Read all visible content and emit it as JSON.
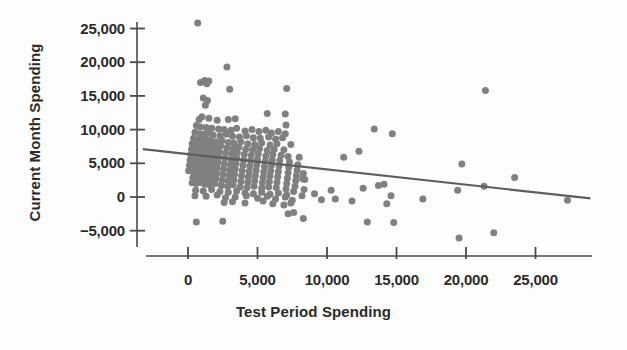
{
  "chart_data": {
    "type": "scatter",
    "title": "",
    "xlabel": "Test Period Spending",
    "ylabel": "Current Month Spending",
    "xlim": [
      -4000,
      29500
    ],
    "ylim": [
      -7500,
      26500
    ],
    "grid": false,
    "legend": null,
    "xticks": [
      0,
      5000,
      10000,
      15000,
      20000,
      25000
    ],
    "xticklabels": [
      "0",
      "5,000",
      "10,000",
      "15,000",
      "20,000",
      "25,000"
    ],
    "yticks": [
      -5000,
      0,
      5000,
      10000,
      15000,
      20000,
      25000
    ],
    "yticklabels": [
      "−5,000",
      "0",
      "5,000",
      "10,000",
      "15,000",
      "20,000",
      "25,000"
    ],
    "marker_color": "#808080",
    "marker_size": 7,
    "line_color": "#5e5e5e",
    "axis_color": "#4a4a4a",
    "text_color": "#2b2b2b",
    "background": "#fdfdfd",
    "trendline": {
      "type": "linear-fit",
      "x_start": -3250,
      "y_start": 7100,
      "x_end": 28950,
      "y_end": -200,
      "slope": -0.2267,
      "intercept": 6363
    },
    "points": [
      [
        700,
        25800
      ],
      [
        2800,
        19300
      ],
      [
        1200,
        17300
      ],
      [
        1500,
        17200
      ],
      [
        900,
        17000
      ],
      [
        1350,
        16800
      ],
      [
        21400,
        15800
      ],
      [
        7100,
        16100
      ],
      [
        3000,
        16000
      ],
      [
        1100,
        14700
      ],
      [
        1400,
        14300
      ],
      [
        1250,
        13600
      ],
      [
        5700,
        12400
      ],
      [
        7000,
        12300
      ],
      [
        3400,
        11600
      ],
      [
        2900,
        11500
      ],
      [
        1000,
        11900
      ],
      [
        1500,
        11700
      ],
      [
        800,
        11500
      ],
      [
        2100,
        11400
      ],
      [
        7050,
        10700
      ],
      [
        13400,
        10100
      ],
      [
        14700,
        9400
      ],
      [
        600,
        10600
      ],
      [
        900,
        10400
      ],
      [
        1300,
        10300
      ],
      [
        1700,
        10200
      ],
      [
        2200,
        10100
      ],
      [
        2600,
        10000
      ],
      [
        3100,
        9900
      ],
      [
        3500,
        10200
      ],
      [
        4100,
        9800
      ],
      [
        4600,
        10000
      ],
      [
        5100,
        9700
      ],
      [
        5600,
        9900
      ],
      [
        6000,
        9500
      ],
      [
        6500,
        9700
      ],
      [
        7000,
        9400
      ],
      [
        500,
        9600
      ],
      [
        850,
        9400
      ],
      [
        1150,
        9300
      ],
      [
        1450,
        9500
      ],
      [
        1800,
        9200
      ],
      [
        2300,
        9100
      ],
      [
        2750,
        9300
      ],
      [
        3200,
        9000
      ],
      [
        3700,
        8900
      ],
      [
        4200,
        9100
      ],
      [
        4700,
        8800
      ],
      [
        5200,
        8700
      ],
      [
        5800,
        8900
      ],
      [
        6300,
        8600
      ],
      [
        6800,
        8800
      ],
      [
        400,
        8700
      ],
      [
        750,
        8500
      ],
      [
        1050,
        8400
      ],
      [
        1350,
        8600
      ],
      [
        1650,
        8300
      ],
      [
        2000,
        8200
      ],
      [
        2450,
        8400
      ],
      [
        2900,
        8100
      ],
      [
        3300,
        8000
      ],
      [
        3800,
        8200
      ],
      [
        4300,
        7900
      ],
      [
        4800,
        7800
      ],
      [
        5300,
        8000
      ],
      [
        5900,
        7700
      ],
      [
        6400,
        7900
      ],
      [
        7400,
        7800
      ],
      [
        300,
        7900
      ],
      [
        650,
        7700
      ],
      [
        950,
        7600
      ],
      [
        1250,
        7800
      ],
      [
        1550,
        7500
      ],
      [
        1900,
        7400
      ],
      [
        2350,
        7600
      ],
      [
        2800,
        7300
      ],
      [
        3250,
        7200
      ],
      [
        3650,
        7400
      ],
      [
        4150,
        7100
      ],
      [
        4650,
        7000
      ],
      [
        5150,
        7200
      ],
      [
        5700,
        6900
      ],
      [
        6200,
        7100
      ],
      [
        6900,
        7000
      ],
      [
        250,
        7100
      ],
      [
        600,
        6900
      ],
      [
        900,
        6800
      ],
      [
        1200,
        7000
      ],
      [
        1500,
        6700
      ],
      [
        1850,
        6600
      ],
      [
        2250,
        6800
      ],
      [
        2700,
        6500
      ],
      [
        3150,
        6400
      ],
      [
        3550,
        6600
      ],
      [
        4050,
        6300
      ],
      [
        4550,
        6200
      ],
      [
        5050,
        6400
      ],
      [
        5600,
        6100
      ],
      [
        6100,
        6300
      ],
      [
        6700,
        6200
      ],
      [
        7200,
        6000
      ],
      [
        200,
        6300
      ],
      [
        550,
        6100
      ],
      [
        850,
        6000
      ],
      [
        1150,
        6200
      ],
      [
        1450,
        5900
      ],
      [
        1800,
        5800
      ],
      [
        2200,
        6000
      ],
      [
        2650,
        5700
      ],
      [
        3100,
        5600
      ],
      [
        3500,
        5800
      ],
      [
        4000,
        5500
      ],
      [
        4500,
        5400
      ],
      [
        5000,
        5600
      ],
      [
        5550,
        5300
      ],
      [
        6050,
        5500
      ],
      [
        6600,
        5400
      ],
      [
        7300,
        5200
      ],
      [
        8000,
        5900
      ],
      [
        150,
        5500
      ],
      [
        500,
        5300
      ],
      [
        800,
        5200
      ],
      [
        1100,
        5400
      ],
      [
        1400,
        5100
      ],
      [
        1750,
        5000
      ],
      [
        2150,
        5200
      ],
      [
        2600,
        4900
      ],
      [
        3050,
        4800
      ],
      [
        3450,
        5000
      ],
      [
        3950,
        4700
      ],
      [
        4450,
        4600
      ],
      [
        4950,
        4800
      ],
      [
        5500,
        4500
      ],
      [
        6000,
        4700
      ],
      [
        6550,
        4600
      ],
      [
        7250,
        4400
      ],
      [
        7900,
        4800
      ],
      [
        100,
        4700
      ],
      [
        450,
        4500
      ],
      [
        750,
        4400
      ],
      [
        1050,
        4600
      ],
      [
        1350,
        4300
      ],
      [
        1700,
        4200
      ],
      [
        2100,
        4400
      ],
      [
        2550,
        4100
      ],
      [
        3000,
        4000
      ],
      [
        3400,
        4200
      ],
      [
        3900,
        3900
      ],
      [
        4400,
        3800
      ],
      [
        4900,
        4000
      ],
      [
        5450,
        3700
      ],
      [
        5950,
        3900
      ],
      [
        6500,
        3800
      ],
      [
        7200,
        3600
      ],
      [
        7850,
        4000
      ],
      [
        8300,
        3500
      ],
      [
        50,
        3900
      ],
      [
        400,
        3700
      ],
      [
        700,
        3600
      ],
      [
        1000,
        3800
      ],
      [
        1300,
        3500
      ],
      [
        1650,
        3400
      ],
      [
        2050,
        3600
      ],
      [
        2500,
        3300
      ],
      [
        2950,
        3200
      ],
      [
        3350,
        3400
      ],
      [
        3850,
        3100
      ],
      [
        4350,
        3000
      ],
      [
        4850,
        3200
      ],
      [
        5400,
        2900
      ],
      [
        5900,
        3100
      ],
      [
        6450,
        3000
      ],
      [
        7150,
        2800
      ],
      [
        7800,
        3200
      ],
      [
        8250,
        2700
      ],
      [
        350,
        2900
      ],
      [
        650,
        2800
      ],
      [
        950,
        3000
      ],
      [
        1250,
        2700
      ],
      [
        1600,
        2600
      ],
      [
        2000,
        2800
      ],
      [
        2450,
        2500
      ],
      [
        2900,
        2400
      ],
      [
        3300,
        2600
      ],
      [
        3800,
        2300
      ],
      [
        4300,
        2200
      ],
      [
        4800,
        2400
      ],
      [
        5350,
        2100
      ],
      [
        5850,
        2300
      ],
      [
        6400,
        2200
      ],
      [
        7100,
        2000
      ],
      [
        7750,
        2400
      ],
      [
        8400,
        2600
      ],
      [
        300,
        2100
      ],
      [
        600,
        2000
      ],
      [
        900,
        2200
      ],
      [
        1200,
        1900
      ],
      [
        1550,
        1800
      ],
      [
        1950,
        2000
      ],
      [
        2400,
        1700
      ],
      [
        2850,
        1600
      ],
      [
        3250,
        1800
      ],
      [
        3750,
        1500
      ],
      [
        4250,
        1400
      ],
      [
        4750,
        1600
      ],
      [
        5300,
        1300
      ],
      [
        5800,
        1500
      ],
      [
        6350,
        1400
      ],
      [
        7050,
        1200
      ],
      [
        7700,
        1600
      ],
      [
        8350,
        1100
      ],
      [
        550,
        1000
      ],
      [
        1100,
        900
      ],
      [
        1700,
        1100
      ],
      [
        2300,
        800
      ],
      [
        2900,
        700
      ],
      [
        3500,
        900
      ],
      [
        4100,
        600
      ],
      [
        4700,
        500
      ],
      [
        5300,
        700
      ],
      [
        5900,
        400
      ],
      [
        6500,
        600
      ],
      [
        7100,
        300
      ],
      [
        7600,
        800
      ],
      [
        8200,
        200
      ],
      [
        500,
        200
      ],
      [
        1300,
        100
      ],
      [
        2100,
        300
      ],
      [
        2700,
        -100
      ],
      [
        3400,
        0
      ],
      [
        4200,
        200
      ],
      [
        5000,
        -200
      ],
      [
        5700,
        100
      ],
      [
        6300,
        -300
      ],
      [
        7000,
        0
      ],
      [
        7500,
        -500
      ],
      [
        2600,
        -800
      ],
      [
        3200,
        -700
      ],
      [
        4100,
        -900
      ],
      [
        5400,
        -600
      ],
      [
        6100,
        -1000
      ],
      [
        6900,
        -1200
      ],
      [
        7400,
        -900
      ],
      [
        7200,
        -2500
      ],
      [
        7600,
        -2300
      ],
      [
        8300,
        -3200
      ],
      [
        600,
        -3700
      ],
      [
        2500,
        -3600
      ],
      [
        9100,
        500
      ],
      [
        9600,
        -400
      ],
      [
        10300,
        1000
      ],
      [
        10600,
        -300
      ],
      [
        11200,
        5900
      ],
      [
        11800,
        -600
      ],
      [
        12300,
        6800
      ],
      [
        12600,
        1300
      ],
      [
        12900,
        -3700
      ],
      [
        13700,
        1700
      ],
      [
        14100,
        1900
      ],
      [
        14600,
        200
      ],
      [
        14300,
        -1000
      ],
      [
        14800,
        -3800
      ],
      [
        16900,
        -300
      ],
      [
        19400,
        1000
      ],
      [
        19700,
        4900
      ],
      [
        19500,
        -6100
      ],
      [
        21300,
        1600
      ],
      [
        22000,
        -5300
      ],
      [
        23500,
        2900
      ],
      [
        27300,
        -500
      ]
    ]
  },
  "axis_titles": {
    "x": "Test Period Spending",
    "y": "Current Month Spending"
  }
}
